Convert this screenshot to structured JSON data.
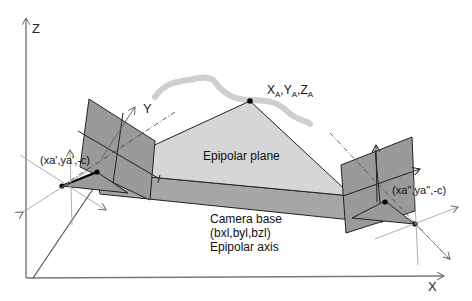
{
  "diagram": {
    "axes": {
      "z_label": "Z",
      "x_label": "X",
      "y_label": "Y"
    },
    "object_point": {
      "label_main": "X",
      "label_sub": "A",
      "label_y": "Y",
      "label_z": "Z",
      "label_text": "XA,YA,ZA"
    },
    "epipolar_plane_label": "Epipolar plane",
    "camera_base": {
      "line1": "Camera base",
      "line2_text": "(bxl,byl,bzl)",
      "line3": "Epipolar axis"
    },
    "left_image_point": {
      "label_text": "(xa',ya',-c)"
    },
    "right_image_point": {
      "label_text": "(xa'',ya'',-c)"
    },
    "colors": {
      "image_plane": "#9a9a9a",
      "epipolar_plane": "#d6d6d6",
      "camera_base": "#a6a6a6",
      "object_curve": "#cfcfcf",
      "lines": "#111111",
      "thin_axes": "#888888"
    }
  }
}
